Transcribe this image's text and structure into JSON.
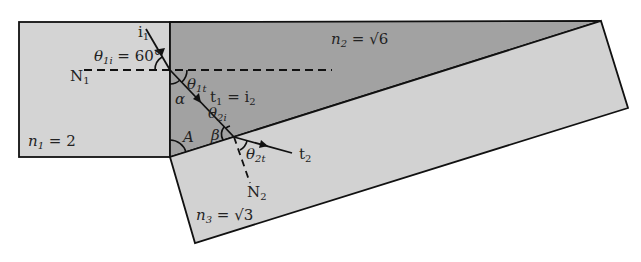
{
  "diagram": {
    "colors": {
      "medium1": "#d4d4d4",
      "medium2": "#a2a2a2",
      "medium3": "#d2d2d2",
      "stroke": "#111111",
      "text": "#222222"
    },
    "media": [
      {
        "id": "n1",
        "label_sym": "n",
        "label_sub": "1",
        "label_val": " = 2"
      },
      {
        "id": "n2",
        "label_sym": "n",
        "label_sub": "2",
        "label_val": " = √6"
      },
      {
        "id": "n3",
        "label_sym": "n",
        "label_sub": "3",
        "label_val": " = √3"
      }
    ],
    "rays": {
      "incident": {
        "sym": "i",
        "sub": "1"
      },
      "middle": {
        "sym1": "t",
        "sub1": "1",
        "eq": " = ",
        "sym2": "i",
        "sub2": "2"
      },
      "transmitted": {
        "sym": "t",
        "sub": "2"
      }
    },
    "normals": {
      "n1": {
        "sym": "N",
        "sub": "1"
      },
      "n2": {
        "sym": "N",
        "sub": "2"
      }
    },
    "angles": {
      "theta1i": {
        "sym": "θ",
        "sub": "1i",
        "val": " = 60°"
      },
      "theta1t": {
        "sym": "θ",
        "sub": "1t"
      },
      "theta2i": {
        "sym": "θ",
        "sub": "2i"
      },
      "theta2t": {
        "sym": "θ",
        "sub": "2t"
      },
      "alpha": "α",
      "beta": "β",
      "A": "A"
    }
  }
}
